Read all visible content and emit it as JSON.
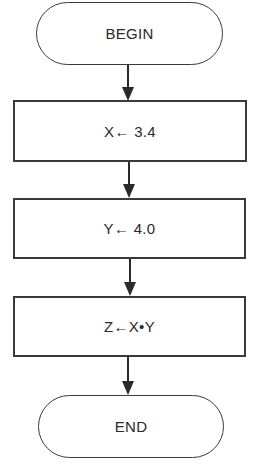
{
  "flowchart": {
    "nodes": [
      {
        "id": "begin",
        "type": "terminal",
        "label": "BEGIN"
      },
      {
        "id": "assign-x",
        "type": "process",
        "label": "X← 3.4"
      },
      {
        "id": "assign-y",
        "type": "process",
        "label": "Y← 4.0"
      },
      {
        "id": "compute-z",
        "type": "process",
        "label": "Z←X•Y"
      },
      {
        "id": "end",
        "type": "terminal",
        "label": "END"
      }
    ],
    "edges": [
      {
        "from": "begin",
        "to": "assign-x"
      },
      {
        "from": "assign-x",
        "to": "assign-y"
      },
      {
        "from": "assign-y",
        "to": "compute-z"
      },
      {
        "from": "compute-z",
        "to": "end"
      }
    ]
  }
}
